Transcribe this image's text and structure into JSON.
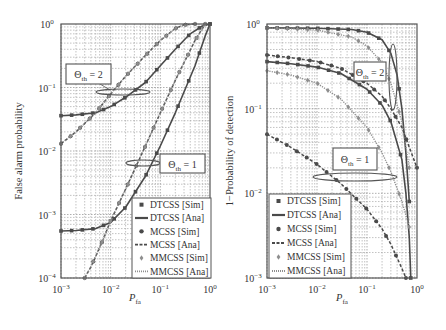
{
  "chart_data": [
    {
      "type": "line",
      "panel": "left",
      "title": "",
      "xlabel": "P_fa",
      "ylabel": "False alarm probability",
      "xscale": "log",
      "yscale": "log",
      "xlim": [
        0.001,
        1
      ],
      "ylim": [
        0.0001,
        1
      ],
      "xticks": [
        "10^-3",
        "10^-2",
        "10^-1",
        "10^0"
      ],
      "yticks": [
        "10^0",
        "10^-1",
        "10^-2",
        "10^-3",
        "10^-4"
      ],
      "grid": true,
      "legend_position": "lower right",
      "annotations": [
        {
          "text": "Θth = 2",
          "target": "threshold 2 curve group"
        },
        {
          "text": "Θth = 1",
          "target": "threshold 1 curve group"
        }
      ],
      "series": [
        {
          "name": "DTCSS [Ana]",
          "group": "Θth = 2",
          "style": "solid",
          "x": [
            0.001,
            0.002,
            0.005,
            0.01,
            0.02,
            0.05,
            0.1,
            0.2,
            0.4,
            0.7,
            1.0
          ],
          "y": [
            0.036,
            0.037,
            0.04,
            0.05,
            0.07,
            0.12,
            0.22,
            0.4,
            0.7,
            0.93,
            1.0
          ]
        },
        {
          "name": "MCSS [Ana]",
          "group": "Θth = 2",
          "style": "dashed",
          "x": [
            0.001,
            0.002,
            0.005,
            0.01,
            0.02,
            0.05,
            0.1,
            0.2,
            0.3,
            0.5
          ],
          "y": [
            0.013,
            0.02,
            0.04,
            0.08,
            0.15,
            0.32,
            0.55,
            0.85,
            0.97,
            1.0
          ]
        },
        {
          "name": "MMCSS [Ana]",
          "group": "Θth = 2",
          "style": "dotted",
          "x": [
            0.001,
            0.002,
            0.005,
            0.01,
            0.02,
            0.05,
            0.1,
            0.2,
            0.3,
            0.5
          ],
          "y": [
            0.013,
            0.02,
            0.04,
            0.08,
            0.15,
            0.32,
            0.55,
            0.85,
            0.97,
            1.0
          ]
        },
        {
          "name": "DTCSS [Ana]",
          "group": "Θth = 1",
          "style": "solid",
          "x": [
            0.001,
            0.002,
            0.005,
            0.01,
            0.02,
            0.05,
            0.1,
            0.2,
            0.5,
            0.8,
            1.0
          ],
          "y": [
            0.00055,
            0.00056,
            0.0006,
            0.00075,
            0.0013,
            0.004,
            0.012,
            0.04,
            0.22,
            0.65,
            1.0
          ]
        },
        {
          "name": "MCSS [Ana]",
          "group": "Θth = 1",
          "style": "dashed",
          "x": [
            0.003,
            0.004,
            0.005,
            0.007,
            0.01,
            0.02,
            0.05,
            0.1,
            0.2,
            0.5,
            0.8
          ],
          "y": [
            0.0001,
            0.00015,
            0.00022,
            0.0004,
            0.0008,
            0.0025,
            0.012,
            0.04,
            0.13,
            0.55,
            1.0
          ]
        },
        {
          "name": "MMCSS [Ana]",
          "group": "Θth = 1",
          "style": "dotted",
          "x": [
            0.003,
            0.004,
            0.005,
            0.007,
            0.01,
            0.02,
            0.05,
            0.1,
            0.2,
            0.5,
            0.8
          ],
          "y": [
            0.0001,
            0.00015,
            0.00022,
            0.0004,
            0.0008,
            0.0025,
            0.012,
            0.04,
            0.13,
            0.55,
            1.0
          ]
        }
      ]
    },
    {
      "type": "line",
      "panel": "right",
      "title": "",
      "xlabel": "P_fa",
      "ylabel": "1−Probability of detection",
      "xscale": "log",
      "yscale": "log",
      "xlim": [
        0.001,
        1
      ],
      "ylim": [
        0.001,
        1
      ],
      "xticks": [
        "10^-3",
        "10^-2",
        "10^-1",
        "10^0"
      ],
      "yticks": [
        "10^0",
        "10^-1",
        "10^-2",
        "10^-3"
      ],
      "grid": true,
      "legend_position": "lower left",
      "annotations": [
        {
          "text": "Θth = 2",
          "target": "threshold 2 curve group"
        },
        {
          "text": "Θth = 1",
          "target": "threshold 1 curve group"
        }
      ],
      "series": [
        {
          "name": "DTCSS [Ana]",
          "group": "Θth = 2",
          "style": "solid",
          "x": [
            0.001,
            0.01,
            0.05,
            0.1,
            0.2,
            0.3,
            0.4,
            0.5,
            0.6,
            0.7
          ],
          "y": [
            0.9,
            0.89,
            0.86,
            0.8,
            0.65,
            0.45,
            0.25,
            0.1,
            0.03,
            0.008
          ]
        },
        {
          "name": "MMCSS [Ana]",
          "group": "Θth = 2",
          "style": "dotted",
          "x": [
            0.001,
            0.01,
            0.05,
            0.1,
            0.2,
            0.3,
            0.5,
            0.7
          ],
          "y": [
            0.9,
            0.85,
            0.7,
            0.55,
            0.35,
            0.2,
            0.07,
            0.02
          ]
        },
        {
          "name": "MCSS [Ana]",
          "group": "Θth = 2",
          "style": "dashed",
          "x": [
            0.001,
            0.003,
            0.01,
            0.03,
            0.1,
            0.2,
            0.3,
            0.5,
            0.7,
            1.0
          ],
          "y": [
            0.43,
            0.4,
            0.36,
            0.3,
            0.2,
            0.14,
            0.1,
            0.06,
            0.035,
            0.02
          ]
        },
        {
          "name": "DTCSS [Ana]",
          "group": "Θth = 1",
          "style": "solid",
          "x": [
            0.001,
            0.003,
            0.01,
            0.03,
            0.1,
            0.2,
            0.3,
            0.5,
            0.6,
            0.7,
            0.75
          ],
          "y": [
            0.36,
            0.34,
            0.31,
            0.26,
            0.17,
            0.11,
            0.07,
            0.025,
            0.01,
            0.003,
            0.001
          ]
        },
        {
          "name": "MMCSS [Ana]",
          "group": "Θth = 1",
          "style": "dotted",
          "x": [
            0.001,
            0.003,
            0.01,
            0.03,
            0.1,
            0.2,
            0.3,
            0.5,
            0.7
          ],
          "y": [
            0.28,
            0.25,
            0.2,
            0.13,
            0.06,
            0.03,
            0.018,
            0.008,
            0.004
          ]
        },
        {
          "name": "MCSS [Ana]",
          "group": "Θth = 1",
          "style": "dashed",
          "x": [
            0.001,
            0.003,
            0.01,
            0.03,
            0.1,
            0.2,
            0.3,
            0.5,
            0.6
          ],
          "y": [
            0.05,
            0.035,
            0.022,
            0.013,
            0.0065,
            0.0038,
            0.0025,
            0.0013,
            0.001
          ]
        }
      ]
    }
  ],
  "legend": {
    "items": [
      {
        "label": "DTCSS [Sim]",
        "kind": "square-marker"
      },
      {
        "label": "DTCSS [Ana]",
        "kind": "solid-line"
      },
      {
        "label": "MCSS [Sim]",
        "kind": "circle-marker"
      },
      {
        "label": "MCSS [Ana]",
        "kind": "dashed-line"
      },
      {
        "label": "MMCSS [Sim]",
        "kind": "diamond-marker"
      },
      {
        "label": "MMCSS [Ana]",
        "kind": "dotted-line"
      }
    ]
  },
  "labels": {
    "left_ylabel": "False alarm probability",
    "right_ylabel": "1−Probability of detection",
    "xlabel_main": "P",
    "xlabel_sub": "fa",
    "theta_main": "Θ",
    "theta_sub": "th",
    "theta2": " = 2",
    "theta1": " = 1"
  },
  "colors": {
    "dark": "#4a4a4a",
    "mid": "#6b6b6b",
    "light": "#8e8e8e",
    "grid": "#9a9a9a",
    "axis": "#555555"
  }
}
